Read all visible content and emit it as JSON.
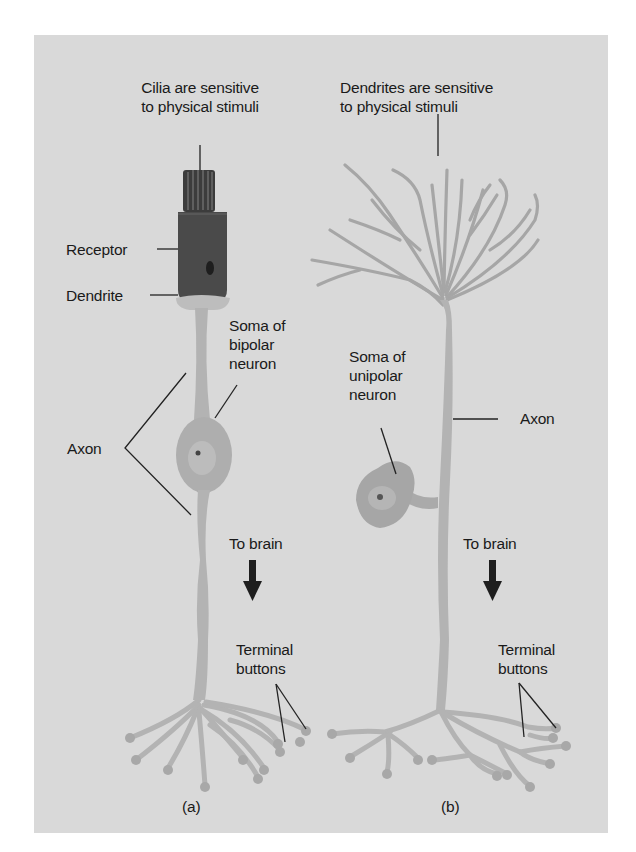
{
  "figure": {
    "panel_color": "#d9d9d9",
    "neuron_color": "#b3b3b3",
    "receptor_color": "#4a4a4a",
    "panels": [
      {
        "id": "a",
        "caption": "(a)",
        "labels": {
          "stimulus_line1": "Cilia are sensitive",
          "stimulus_line2": "to physical stimuli",
          "receptor": "Receptor",
          "dendrite": "Dendrite",
          "soma_line1": "Soma of",
          "soma_line2": "bipolar",
          "soma_line3": "neuron",
          "axon": "Axon",
          "direction": "To brain",
          "terminal_line1": "Terminal",
          "terminal_line2": "buttons"
        }
      },
      {
        "id": "b",
        "caption": "(b)",
        "labels": {
          "stimulus_line1": "Dendrites are sensitive",
          "stimulus_line2": "to physical stimuli",
          "soma_line1": "Soma of",
          "soma_line2": "unipolar",
          "soma_line3": "neuron",
          "axon": "Axon",
          "direction": "To brain",
          "terminal_line1": "Terminal",
          "terminal_line2": "buttons"
        }
      }
    ]
  }
}
